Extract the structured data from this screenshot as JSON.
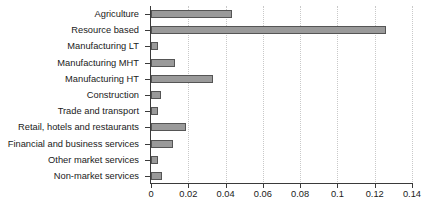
{
  "chart_data": {
    "type": "bar",
    "orientation": "horizontal",
    "title": "",
    "subtitle": "",
    "xlabel": "",
    "ylabel": "",
    "xlim": [
      0,
      0.14
    ],
    "xticks": [
      "0",
      "0.02",
      "0.04",
      "0.06",
      "0.08",
      "0.1",
      "0.12",
      "0.14"
    ],
    "xtick_values": [
      0,
      0.02,
      0.04,
      0.06,
      0.08,
      0.1,
      0.12,
      0.14
    ],
    "grid": "vertical-dotted",
    "legend": "none",
    "categories": [
      "Agriculture",
      "Resource based",
      "Manufacturing LT",
      "Manufacturing MHT",
      "Manufacturing HT",
      "Construction",
      "Trade and transport",
      "Retail, hotels and restaurants",
      "Financial and business services",
      "Other market services",
      "Non-market services"
    ],
    "values": [
      0.0435,
      0.126,
      0.004,
      0.013,
      0.033,
      0.0055,
      0.0035,
      0.019,
      0.012,
      0.004,
      0.006
    ],
    "series": [
      {
        "name": "value",
        "values": [
          0.0435,
          0.126,
          0.004,
          0.013,
          0.033,
          0.0055,
          0.0035,
          0.019,
          0.012,
          0.004,
          0.006
        ]
      }
    ],
    "colors": {
      "bar_fill": "#9a9a9a",
      "bar_border": "#555555",
      "axis": "#3a3a3a",
      "gridline": "#c9c9c9",
      "background": "#ffffff",
      "text": "#1a1a1a"
    }
  }
}
